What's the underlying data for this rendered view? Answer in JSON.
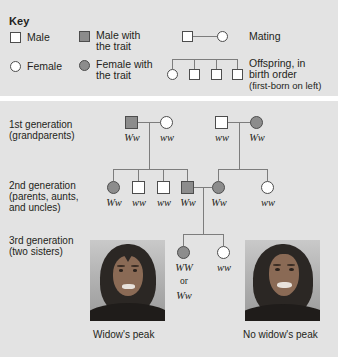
{
  "key": {
    "title": "Key",
    "items": [
      {
        "name": "male",
        "label": "Male",
        "symbol": "square",
        "filled": false
      },
      {
        "name": "female",
        "label": "Female",
        "symbol": "circle",
        "filled": false
      },
      {
        "name": "male-with-trait",
        "label": "Male with\nthe trait",
        "label_line1": "Male with",
        "label_line2": "the trait",
        "symbol": "square",
        "filled": true
      },
      {
        "name": "female-with-trait",
        "label": "Female with\nthe trait",
        "label_line1": "Female with",
        "label_line2": "the trait",
        "symbol": "circle",
        "filled": true
      }
    ],
    "mating_label": "Mating",
    "offspring_label_line1": "Offspring, in",
    "offspring_label_line2": "birth order",
    "offspring_label_line3": "(first-born on left)",
    "mating_symbols": [
      "square",
      "circle"
    ],
    "offspring_symbols": [
      "circle",
      "square",
      "square",
      "square"
    ]
  },
  "pedigree": {
    "generations": [
      {
        "id": "gen1",
        "label_line1": "1st generation",
        "label_line2": "(grandparents)",
        "individuals": [
          {
            "symbol": "square",
            "filled": true,
            "genotype": "Ww"
          },
          {
            "symbol": "circle",
            "filled": false,
            "genotype": "ww"
          },
          {
            "symbol": "square",
            "filled": false,
            "genotype": "ww"
          },
          {
            "symbol": "circle",
            "filled": true,
            "genotype": "Ww"
          }
        ]
      },
      {
        "id": "gen2",
        "label_line1": "2nd generation",
        "label_line2": "(parents, aunts,",
        "label_line3": "and uncles)",
        "individuals": [
          {
            "symbol": "circle",
            "filled": true,
            "genotype": "Ww"
          },
          {
            "symbol": "square",
            "filled": false,
            "genotype": "ww"
          },
          {
            "symbol": "square",
            "filled": false,
            "genotype": "ww"
          },
          {
            "symbol": "square",
            "filled": true,
            "genotype": "Ww"
          },
          {
            "symbol": "circle",
            "filled": true,
            "genotype": "Ww"
          },
          {
            "symbol": "circle",
            "filled": false,
            "genotype": "ww"
          }
        ]
      },
      {
        "id": "gen3",
        "label_line1": "3rd generation",
        "label_line2": "(two sisters)",
        "individuals": [
          {
            "symbol": "circle",
            "filled": true,
            "genotype": "WW",
            "genotype_line2": "or",
            "genotype_line3": "Ww"
          },
          {
            "symbol": "circle",
            "filled": false,
            "genotype": "ww"
          }
        ]
      }
    ],
    "photos": [
      {
        "name": "widows-peak-photo",
        "caption": "Widow's peak",
        "has_peak": true
      },
      {
        "name": "no-widows-peak-photo",
        "caption": "No widow's peak",
        "has_peak": false
      }
    ]
  },
  "colors": {
    "panel_background": "#e3e3e3",
    "page_background": "#ffffff",
    "trait_fill": "#8c8c8c",
    "symbol_stroke": "#4d4d4d",
    "line": "#7d7d7d",
    "text": "#231f20"
  }
}
